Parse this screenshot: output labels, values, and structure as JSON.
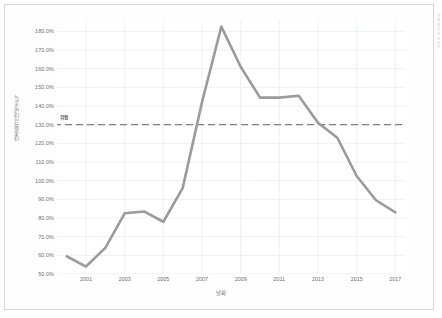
{
  "chart_data": {
    "type": "line",
    "title": "",
    "xlabel": "날짜",
    "ylabel": "대출원금 대비소득",
    "x": [
      2000,
      2001,
      2002,
      2003,
      2004,
      2005,
      2006,
      2007,
      2008,
      2009,
      2010,
      2011,
      2012,
      2013,
      2014,
      2015,
      2016,
      2017
    ],
    "series": [
      {
        "name": "대출원금 대비소득",
        "color": "#9b9b9b",
        "values": [
          59.5,
          54.0,
          64.0,
          82.5,
          83.5,
          78.0,
          96.0,
          142.0,
          182.5,
          161.0,
          144.5,
          144.5,
          145.5,
          131.0,
          123.0,
          102.5,
          89.5,
          83.0
        ]
      }
    ],
    "ylim": [
      50.0,
      185.0
    ],
    "xlim": [
      1999.5,
      2017.5
    ],
    "yticks": [
      50.0,
      60.0,
      70.0,
      80.0,
      90.0,
      100.0,
      110.0,
      120.0,
      130.0,
      140.0,
      150.0,
      160.0,
      170.0,
      180.0
    ],
    "ytick_labels": [
      "50.0%",
      "60.0%",
      "70.0%",
      "80.0%",
      "90.0%",
      "100.0%",
      "110.0%",
      "120.0%",
      "130.0%",
      "140.0%",
      "150.0%",
      "160.0%",
      "170.0%",
      "180.0%"
    ],
    "xticks": [
      2001,
      2003,
      2005,
      2007,
      2009,
      2011,
      2013,
      2015,
      2017
    ],
    "xtick_labels": [
      "2001",
      "2003",
      "2005",
      "2007",
      "2009",
      "2011",
      "2013",
      "2015",
      "2017"
    ],
    "grid": true,
    "grid_color": "#e4eaf0",
    "legend": "none",
    "threshold": {
      "value": 130.0,
      "label": "위험",
      "style": "dashed",
      "color": "#808080"
    },
    "side_caption": "대출원금 대비소득"
  }
}
